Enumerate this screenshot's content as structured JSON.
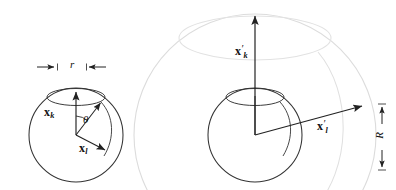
{
  "figure": {
    "background": "#ffffff",
    "stroke_dark": "#222222",
    "stroke_light": "#d8d8d8",
    "width": 396,
    "height": 190
  },
  "left_panel": {
    "name": "small-sphere-panel",
    "radius_label": "r",
    "angle_label": "θ",
    "vector_k": {
      "symbol": "x",
      "subscript": "k"
    },
    "vector_l": {
      "symbol": "x",
      "subscript": "l"
    },
    "sphere": {
      "cx": 76,
      "cy": 135,
      "r": 47
    },
    "cap_ellipse": {
      "cx": 76,
      "cy": 97,
      "rx": 29,
      "ry": 8
    }
  },
  "right_panel": {
    "name": "large-sphere-panel",
    "radius_label": "R",
    "vector_k": {
      "symbol": "x",
      "prime": "′",
      "subscript": "k"
    },
    "vector_l": {
      "symbol": "x",
      "prime": "′",
      "subscript": "l"
    },
    "sphere": {
      "cx": 255,
      "cy": 135,
      "r": 47
    },
    "cap_ellipse": {
      "cx": 255,
      "cy": 97,
      "rx": 29,
      "ry": 8
    },
    "outer_circle": {
      "cx": 255,
      "cy": 135,
      "r": 121
    }
  }
}
